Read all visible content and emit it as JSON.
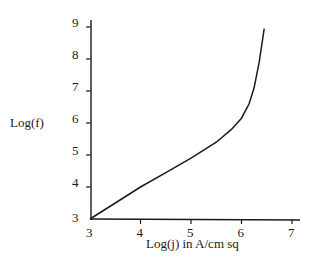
{
  "chart_data": {
    "type": "line",
    "title": "",
    "xlabel": "Log(j) in A/cm sq",
    "ylabel": "Log(f)",
    "xlim": [
      3,
      7
    ],
    "ylim": [
      3,
      9
    ],
    "x_ticks": [
      "3",
      "4",
      "5",
      "6",
      "7"
    ],
    "y_ticks": [
      "3",
      "4",
      "5",
      "6",
      "7",
      "8",
      "9"
    ],
    "grid": false,
    "legend": null,
    "series": [
      {
        "name": "Log(f) vs Log(j)",
        "x": [
          3.0,
          3.5,
          4.0,
          4.5,
          5.0,
          5.5,
          5.8,
          6.0,
          6.15,
          6.25,
          6.35,
          6.45
        ],
        "y": [
          3.0,
          3.5,
          4.0,
          4.45,
          4.9,
          5.4,
          5.8,
          6.15,
          6.6,
          7.1,
          7.9,
          8.95
        ]
      }
    ]
  }
}
